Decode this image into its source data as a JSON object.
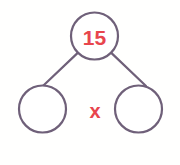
{
  "diagram": {
    "type": "number-bond",
    "background_color": "#fffffe",
    "stroke_color": "#6f6079",
    "accent_color": "#e8454d",
    "stroke_width": 2.2,
    "nodes": [
      {
        "id": "whole",
        "role": "whole",
        "label": "15",
        "value": "15",
        "filled": true,
        "cx": 94.5,
        "cy": 36,
        "r": 23.5,
        "font_size": 21,
        "text_color": "#e8454d"
      },
      {
        "id": "part-left",
        "role": "part",
        "label": "",
        "value": "",
        "filled": false,
        "cx": 42.5,
        "cy": 109,
        "r": 23.5,
        "font_size": 21,
        "text_color": "#e8454d"
      },
      {
        "id": "part-right",
        "role": "part",
        "label": "",
        "value": "",
        "filled": false,
        "cx": 138.5,
        "cy": 109,
        "r": 23.5,
        "font_size": 21,
        "text_color": "#e8454d"
      }
    ],
    "branches": [
      {
        "id": "branch-left",
        "from": "whole",
        "to": "part-left",
        "x1": 78.0,
        "y1": 52.6,
        "x2": 42.9,
        "y2": 86.0
      },
      {
        "id": "branch-right",
        "from": "whole",
        "to": "part-right",
        "x1": 111.0,
        "y1": 52.6,
        "x2": 146.0,
        "y2": 86.0
      }
    ],
    "operator": {
      "id": "multiplication-operator",
      "symbol": "x",
      "x": 95,
      "y": 111,
      "font_size": 20,
      "color": "#e8454d"
    }
  }
}
